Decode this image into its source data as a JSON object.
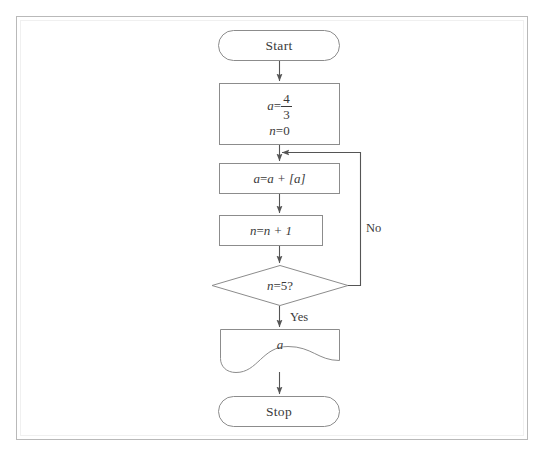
{
  "diagram": {
    "type": "flowchart",
    "stroke_color": "#8c8c8c",
    "text_color": "#3a3a3a",
    "background_color": "#ffffff",
    "frame_color": "#b9b9b9",
    "nodes": [
      {
        "id": "start",
        "shape": "terminator",
        "label": "Start",
        "x": 218,
        "y": 30,
        "w": 122,
        "h": 31
      },
      {
        "id": "init",
        "shape": "process",
        "label": "a = 4/3 ; n = 0",
        "line1_lhs": "a",
        "line1_op": "=",
        "line1_numerator": "4",
        "line1_denominator": "3",
        "line2_lhs": "n",
        "line2_op": "=",
        "line2_rhs": "0",
        "x": 219,
        "y": 83,
        "w": 121,
        "h": 62
      },
      {
        "id": "update_a",
        "shape": "process",
        "label": "a = a + [a]",
        "lhs": "a",
        "op": "=",
        "rhs": "a + [a]",
        "x": 219,
        "y": 163,
        "w": 121,
        "h": 31
      },
      {
        "id": "update_n",
        "shape": "process",
        "label": "n = n + 1",
        "lhs": "n",
        "op": "=",
        "rhs": "n + 1",
        "x": 219,
        "y": 215,
        "w": 104,
        "h": 31
      },
      {
        "id": "decision",
        "shape": "diamond",
        "label": "n = 5 ?",
        "lhs": "n",
        "op": "=",
        "rhs": "5",
        "question_mark": "?",
        "x": 212,
        "y": 265,
        "w": 136,
        "h": 40
      },
      {
        "id": "output",
        "shape": "document",
        "label": "a",
        "value": "a",
        "x": 220,
        "y": 329,
        "w": 120,
        "h": 45
      },
      {
        "id": "stop",
        "shape": "terminator",
        "label": "Stop",
        "x": 218,
        "y": 396,
        "w": 122,
        "h": 31
      }
    ],
    "edges": [
      {
        "id": "start-to-init",
        "from": "start",
        "to": "init",
        "label": ""
      },
      {
        "id": "init-to-update-a",
        "from": "init",
        "to": "update_a",
        "label": ""
      },
      {
        "id": "update-a-to-update-n",
        "from": "update_a",
        "to": "update_n",
        "label": ""
      },
      {
        "id": "update-n-to-decision",
        "from": "update_n",
        "to": "decision",
        "label": ""
      },
      {
        "id": "decision-no-loop",
        "from": "decision",
        "to": "update_a",
        "label": "No"
      },
      {
        "id": "decision-yes-to-output",
        "from": "decision",
        "to": "output",
        "label": "Yes"
      },
      {
        "id": "output-to-stop",
        "from": "output",
        "to": "stop",
        "label": ""
      }
    ],
    "labels": {
      "no": "No",
      "yes": "Yes"
    }
  }
}
